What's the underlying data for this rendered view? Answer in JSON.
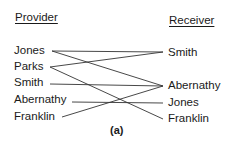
{
  "headers": {
    "provider": "Provider",
    "receiver": "Receiver"
  },
  "providers": [
    "Jones",
    "Parks",
    "Smith",
    "Abernathy",
    "Franklin"
  ],
  "receivers": [
    "Smith",
    "Abernathy",
    "Jones",
    "Franklin"
  ],
  "connections": [
    {
      "from": "Jones",
      "to": "Smith"
    },
    {
      "from": "Jones",
      "to": "Abernathy"
    },
    {
      "from": "Parks",
      "to": "Smith"
    },
    {
      "from": "Parks",
      "to": "Franklin"
    },
    {
      "from": "Smith",
      "to": "Abernathy"
    },
    {
      "from": "Abernathy",
      "to": "Jones"
    },
    {
      "from": "Franklin",
      "to": "Abernathy"
    }
  ],
  "caption": "(a)",
  "line_color": "#333333"
}
